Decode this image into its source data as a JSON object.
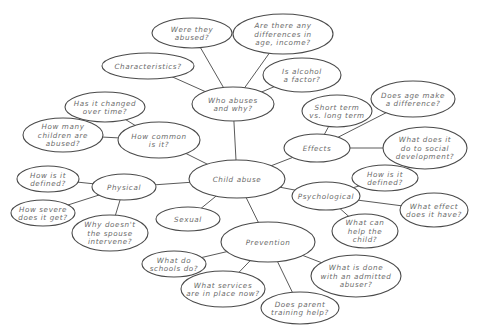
{
  "diagram": {
    "type": "mind-map",
    "colors": {
      "stroke": "#4a4a4a",
      "edge": "#5a5a5a",
      "text": "#6a6a6a",
      "background": "#ffffff"
    },
    "nodes": [
      {
        "id": "child-abuse",
        "lines": [
          "Child abuse"
        ],
        "cx": 237,
        "cy": 179,
        "rx": 48,
        "ry": 19
      },
      {
        "id": "who-abuses",
        "lines": [
          "Who abuses",
          "and why?"
        ],
        "cx": 233,
        "cy": 104,
        "rx": 41,
        "ry": 17
      },
      {
        "id": "were-they-abused",
        "lines": [
          "Were they",
          "abused?"
        ],
        "cx": 192,
        "cy": 33,
        "rx": 40,
        "ry": 15
      },
      {
        "id": "differences",
        "lines": [
          "Are there any",
          "differences in",
          "age, income?"
        ],
        "cx": 283,
        "cy": 34,
        "rx": 50,
        "ry": 20
      },
      {
        "id": "characteristics",
        "lines": [
          "Characteristics?"
        ],
        "cx": 148,
        "cy": 66,
        "rx": 46,
        "ry": 13
      },
      {
        "id": "alcohol",
        "lines": [
          "Is alcohol",
          "a factor?"
        ],
        "cx": 302,
        "cy": 75,
        "rx": 39,
        "ry": 17
      },
      {
        "id": "how-common",
        "lines": [
          "How common",
          "is it?"
        ],
        "cx": 159,
        "cy": 140,
        "rx": 41,
        "ry": 18
      },
      {
        "id": "changed-over-time",
        "lines": [
          "Has it changed",
          "over time?"
        ],
        "cx": 105,
        "cy": 107,
        "rx": 40,
        "ry": 15
      },
      {
        "id": "how-many-children",
        "lines": [
          "How many",
          "children are",
          "abused?"
        ],
        "cx": 63,
        "cy": 135,
        "rx": 40,
        "ry": 17
      },
      {
        "id": "effects",
        "lines": [
          "Effects"
        ],
        "cx": 317,
        "cy": 148,
        "rx": 33,
        "ry": 14
      },
      {
        "id": "short-vs-long",
        "lines": [
          "Short term",
          "vs. long term"
        ],
        "cx": 337,
        "cy": 111,
        "rx": 35,
        "ry": 16
      },
      {
        "id": "age-difference",
        "lines": [
          "Does age make",
          "a difference?"
        ],
        "cx": 413,
        "cy": 99,
        "rx": 42,
        "ry": 18
      },
      {
        "id": "social-development",
        "lines": [
          "What does it",
          "do to social",
          "development?"
        ],
        "cx": 425,
        "cy": 148,
        "rx": 42,
        "ry": 21
      },
      {
        "id": "physical",
        "lines": [
          "Physical"
        ],
        "cx": 124,
        "cy": 187,
        "rx": 32,
        "ry": 13
      },
      {
        "id": "physical-defined",
        "lines": [
          "How is it",
          "defined?"
        ],
        "cx": 48,
        "cy": 179,
        "rx": 31,
        "ry": 13
      },
      {
        "id": "how-severe",
        "lines": [
          "How severe",
          "does it get?"
        ],
        "cx": 43,
        "cy": 213,
        "rx": 32,
        "ry": 13
      },
      {
        "id": "spouse-intervene",
        "lines": [
          "Why doesn't",
          "the spouse",
          "intervene?"
        ],
        "cx": 110,
        "cy": 233,
        "rx": 38,
        "ry": 18
      },
      {
        "id": "sexual",
        "lines": [
          "Sexual"
        ],
        "cx": 188,
        "cy": 219,
        "rx": 32,
        "ry": 12
      },
      {
        "id": "psychological",
        "lines": [
          "Psychological"
        ],
        "cx": 326,
        "cy": 196,
        "rx": 34,
        "ry": 14
      },
      {
        "id": "psych-defined",
        "lines": [
          "How is it",
          "defined?"
        ],
        "cx": 385,
        "cy": 178,
        "rx": 33,
        "ry": 13
      },
      {
        "id": "what-effect",
        "lines": [
          "What effect",
          "does it have?"
        ],
        "cx": 434,
        "cy": 210,
        "rx": 34,
        "ry": 17
      },
      {
        "id": "help-child",
        "lines": [
          "What can",
          "help the",
          "child?"
        ],
        "cx": 365,
        "cy": 231,
        "rx": 33,
        "ry": 17
      },
      {
        "id": "prevention",
        "lines": [
          "Prevention"
        ],
        "cx": 268,
        "cy": 242,
        "rx": 47,
        "ry": 20
      },
      {
        "id": "schools",
        "lines": [
          "What do",
          "schools do?"
        ],
        "cx": 174,
        "cy": 264,
        "rx": 32,
        "ry": 13
      },
      {
        "id": "services",
        "lines": [
          "What services",
          "are in place now?"
        ],
        "cx": 223,
        "cy": 289,
        "rx": 42,
        "ry": 18
      },
      {
        "id": "admitted-abuser",
        "lines": [
          "What is done",
          "with an admitted",
          "abuser?"
        ],
        "cx": 356,
        "cy": 276,
        "rx": 45,
        "ry": 21
      },
      {
        "id": "parent-training",
        "lines": [
          "Does parent",
          "training help?"
        ],
        "cx": 300,
        "cy": 308,
        "rx": 39,
        "ry": 16
      }
    ],
    "edges": [
      [
        "child-abuse",
        "who-abuses"
      ],
      [
        "child-abuse",
        "how-common"
      ],
      [
        "child-abuse",
        "effects"
      ],
      [
        "child-abuse",
        "physical"
      ],
      [
        "child-abuse",
        "sexual"
      ],
      [
        "child-abuse",
        "psychological"
      ],
      [
        "child-abuse",
        "prevention"
      ],
      [
        "who-abuses",
        "were-they-abused"
      ],
      [
        "who-abuses",
        "differences"
      ],
      [
        "who-abuses",
        "characteristics"
      ],
      [
        "who-abuses",
        "alcohol"
      ],
      [
        "how-common",
        "changed-over-time"
      ],
      [
        "how-common",
        "how-many-children"
      ],
      [
        "effects",
        "short-vs-long"
      ],
      [
        "effects",
        "age-difference"
      ],
      [
        "effects",
        "social-development"
      ],
      [
        "physical",
        "physical-defined"
      ],
      [
        "physical",
        "how-severe"
      ],
      [
        "physical",
        "spouse-intervene"
      ],
      [
        "psychological",
        "psych-defined"
      ],
      [
        "psychological",
        "what-effect"
      ],
      [
        "psychological",
        "help-child"
      ],
      [
        "prevention",
        "schools"
      ],
      [
        "prevention",
        "services"
      ],
      [
        "prevention",
        "admitted-abuser"
      ],
      [
        "prevention",
        "parent-training"
      ]
    ]
  }
}
